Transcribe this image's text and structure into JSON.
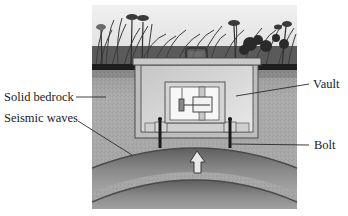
{
  "diagram": {
    "type": "seismometer-vault-cross-section",
    "labels": {
      "solid_bedrock": "Solid bedrock",
      "seismic_waves": "Seismic waves",
      "vault": "Vault",
      "bolt": "Bolt"
    },
    "components": {
      "ground_surface": "grass-and-flowers",
      "vault_box": "underground-vault-with-lid-and-handle",
      "instrument": "pendulum-seismometer",
      "bolts": 2,
      "wavefronts": 2,
      "arrow_direction": "up"
    },
    "colors": {
      "sky": "#ebebeb",
      "grass": "#4a4a4a",
      "soil_line": "#1c1c1c",
      "bedrock": "#a9a9a9",
      "vault_wall": "#b8b8b8",
      "vault_interior": "#d9d9d9",
      "instrument_bg": "#f7f7f7",
      "outline": "#555555",
      "bolt": "#1a1a1a",
      "wave_dark": "#6a6a6a"
    }
  }
}
